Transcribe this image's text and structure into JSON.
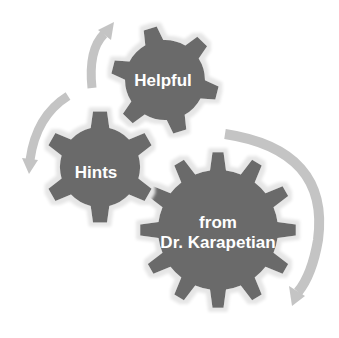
{
  "diagram": {
    "type": "gear-cycle",
    "colors": {
      "background": "#ffffff",
      "gear": "#6b6b6b",
      "gear_halo": "#f0f0f0",
      "arrow": "#c4c4c4",
      "text": "#ffffff"
    },
    "gears": [
      {
        "id": "helpful",
        "label_lines": [
          "Helpful"
        ]
      },
      {
        "id": "hints",
        "label_lines": [
          "Hints"
        ]
      },
      {
        "id": "from-dr-karapetian",
        "label_lines": [
          "from",
          "Dr. Karapetian"
        ]
      }
    ],
    "arrows": [
      {
        "id": "arrow-up-left",
        "direction": "up"
      },
      {
        "id": "arrow-down-left",
        "direction": "down"
      },
      {
        "id": "arrow-right-clockwise",
        "direction": "down"
      }
    ]
  }
}
